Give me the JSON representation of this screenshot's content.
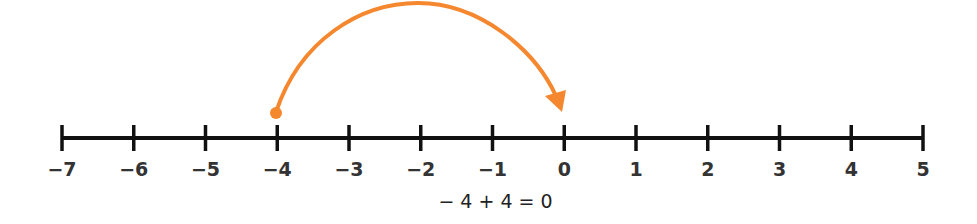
{
  "diagram": {
    "type": "number-line",
    "min": -7,
    "max": 5,
    "ticks": [
      "−7",
      "−6",
      "−5",
      "−4",
      "−3",
      "−2",
      "−1",
      "0",
      "1",
      "2",
      "3",
      "4",
      "5"
    ],
    "jump": {
      "start": -4,
      "end": 0,
      "length": 4,
      "direction": "right"
    },
    "equation": "− 4 + 4 = 0",
    "colors": {
      "axis": "#111111",
      "arrow": "#f5872e",
      "labels": "#333333"
    }
  }
}
